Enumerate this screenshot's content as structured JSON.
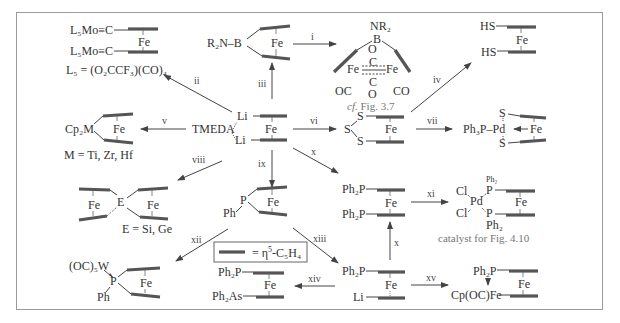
{
  "figure": {
    "border_color": "#9a9a9a",
    "ring_color": "#555555",
    "text_color": "#333333",
    "caption_color": "#777777"
  },
  "center": {
    "label_li_top": "Li",
    "label_li_bottom": "Li",
    "label_fe": "Fe",
    "label_tmeda": "TMEDA"
  },
  "reactions": [
    {
      "id": "i",
      "label": "i"
    },
    {
      "id": "ii",
      "label": "ii"
    },
    {
      "id": "iii",
      "label": "iii"
    },
    {
      "id": "iv",
      "label": "iv"
    },
    {
      "id": "v",
      "label": "v"
    },
    {
      "id": "vi",
      "label": "vi"
    },
    {
      "id": "vii",
      "label": "vii"
    },
    {
      "id": "viii",
      "label": "viii"
    },
    {
      "id": "ix",
      "label": "ix"
    },
    {
      "id": "x",
      "label": "x"
    },
    {
      "id": "x2",
      "label": "x"
    },
    {
      "id": "xi",
      "label": "xi"
    },
    {
      "id": "xii",
      "label": "xii"
    },
    {
      "id": "xiii",
      "label": "xiii"
    },
    {
      "id": "xiv",
      "label": "xiv"
    },
    {
      "id": "xv",
      "label": "xv"
    }
  ],
  "compounds": {
    "mo_carbyne": {
      "top": "L₅Mo≡C",
      "bottom": "L₅Mo≡C",
      "fe": "Fe",
      "definition": "L₅ = (O₂CCF₃)(CO)₄"
    },
    "borane": {
      "group": "R₂N–B",
      "fe": "Fe"
    },
    "fe2_borane": {
      "nr2": "NR₂",
      "b": "B",
      "o_top": "O",
      "c_top": "C",
      "fe_left": "Fe",
      "fe_right": "Fe",
      "c_bottom": "C",
      "o_bottom": "O",
      "oc": "OC",
      "co": "CO",
      "caption_italic": "cf.",
      "caption_rest": " Fig. 3.7"
    },
    "dithiol": {
      "top": "HS",
      "bottom": "HS",
      "fe": "Fe"
    },
    "metallocenophane": {
      "group": "Cp₂M",
      "fe": "Fe",
      "definition": "M = Ti, Zr, Hf"
    },
    "trisulfide": {
      "s_top": "S",
      "s_mid": "S",
      "s_bottom": "S",
      "fe": "Fe"
    },
    "pd_complex": {
      "s_top": "S",
      "s_bottom": "S",
      "group": "Ph₃P–Pd",
      "fe": "Fe"
    },
    "spiro": {
      "e": "E",
      "fe_left": "Fe",
      "fe_right": "Fe",
      "definition": "E = Si, Ge"
    },
    "phosphane": {
      "p": "P",
      "ph": "Ph",
      "fe": "Fe"
    },
    "dppf": {
      "top": "Ph₂P",
      "bottom": "Ph₂P",
      "fe": "Fe"
    },
    "pdcl2_dppf": {
      "cl_top": "Cl",
      "cl_bottom": "Cl",
      "pd": "Pd",
      "ph2_top": "Ph₂",
      "p_top": "P",
      "p_bottom": "P",
      "ph2_bottom": "Ph₂",
      "fe": "Fe",
      "caption": "catalyst for Fig. 4.10"
    },
    "w_phosphane": {
      "w": "(OC)₅W",
      "p": "P",
      "ph": "Ph",
      "fe": "Fe"
    },
    "legend": {
      "equals": "= η",
      "sup": "5",
      "rest": "-C₅H₄"
    },
    "p_as": {
      "top": "Ph₂P",
      "bottom": "Ph₂As",
      "fe": "Fe"
    },
    "p_li": {
      "top": "Ph₂P",
      "bottom": "Li",
      "fe": "Fe"
    },
    "p_fe_cp": {
      "top": "Ph₂P",
      "bottom": "Cp(OC)Fe",
      "fe": "Fe"
    }
  }
}
